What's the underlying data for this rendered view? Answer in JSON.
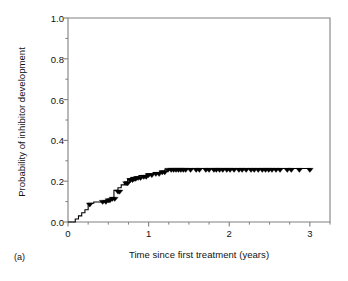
{
  "figure": {
    "panel_letter": "(a)",
    "background_color": "#ffffff",
    "line_color": "#000000",
    "axis_color": "#808080",
    "text_color": "#111111"
  },
  "chart_data": {
    "type": "line",
    "title": "",
    "subtitle": "",
    "xlabel": "Time since first treatment (years)",
    "ylabel": "Probability of inhibitor development",
    "xlim": [
      0,
      3.25
    ],
    "ylim": [
      0.0,
      1.0
    ],
    "xticks": [
      0,
      1,
      2,
      3
    ],
    "xtick_labels": [
      "0",
      "1",
      "2",
      "3"
    ],
    "xminor_ticks": [
      0.25,
      0.5,
      0.75,
      1.25,
      1.5,
      1.75,
      2.25,
      2.5,
      2.75,
      3.25
    ],
    "yticks": [
      0.0,
      0.2,
      0.4,
      0.6,
      0.8,
      1.0
    ],
    "ytick_labels": [
      "0.0",
      "0.2",
      "0.4",
      "0.6",
      "0.8",
      "1.0"
    ],
    "yminor_ticks": [
      0.1,
      0.3,
      0.5,
      0.7,
      0.9
    ],
    "grid": false,
    "legend": null,
    "legend_position": "none",
    "annotations": [],
    "series": [
      {
        "name": "Cumulative incidence of inhibitor development",
        "style": "kaplan-meier-step",
        "x": [
          0.0,
          0.09,
          0.09,
          0.13,
          0.13,
          0.17,
          0.17,
          0.21,
          0.21,
          0.25,
          0.25,
          0.28,
          0.28,
          0.32,
          0.32,
          0.36,
          0.36,
          0.46,
          0.46,
          0.5,
          0.5,
          0.53,
          0.53,
          0.57,
          0.57,
          0.62,
          0.62,
          0.66,
          0.66,
          0.7,
          0.7,
          0.74,
          0.74,
          0.78,
          0.78,
          0.82,
          0.82,
          0.88,
          0.88,
          0.97,
          0.97,
          1.06,
          1.06,
          1.14,
          1.14,
          1.2,
          1.2,
          1.26,
          1.26,
          3.02
        ],
        "y": [
          0.0,
          0.0,
          0.015,
          0.015,
          0.03,
          0.03,
          0.045,
          0.045,
          0.06,
          0.06,
          0.092,
          0.092,
          0.092,
          0.092,
          0.098,
          0.098,
          0.098,
          0.098,
          0.105,
          0.105,
          0.112,
          0.112,
          0.12,
          0.12,
          0.155,
          0.155,
          0.168,
          0.168,
          0.182,
          0.182,
          0.196,
          0.196,
          0.212,
          0.212,
          0.218,
          0.218,
          0.222,
          0.222,
          0.228,
          0.228,
          0.236,
          0.236,
          0.242,
          0.242,
          0.25,
          0.25,
          0.256,
          0.256,
          0.262,
          0.262
        ],
        "plateau_value": 0.262,
        "censor_marker": "filled-down-triangle",
        "censor_x": [
          0.27,
          0.43,
          0.47,
          0.5,
          0.52,
          0.55,
          0.58,
          0.62,
          0.64,
          0.72,
          0.74,
          0.77,
          0.8,
          0.82,
          0.84,
          0.87,
          0.9,
          0.94,
          0.97,
          1.0,
          1.04,
          1.09,
          1.13,
          1.17,
          1.2,
          1.24,
          1.28,
          1.31,
          1.34,
          1.37,
          1.4,
          1.43,
          1.46,
          1.52,
          1.59,
          1.63,
          1.71,
          1.75,
          1.81,
          1.84,
          1.88,
          1.92,
          1.97,
          2.01,
          2.06,
          2.12,
          2.16,
          2.21,
          2.27,
          2.31,
          2.36,
          2.41,
          2.45,
          2.49,
          2.53,
          2.58,
          2.63,
          2.72,
          2.77,
          2.87,
          3.0
        ],
        "censor_y": [
          0.092,
          0.105,
          0.105,
          0.112,
          0.112,
          0.12,
          0.12,
          0.155,
          0.155,
          0.196,
          0.196,
          0.212,
          0.212,
          0.218,
          0.218,
          0.222,
          0.222,
          0.228,
          0.228,
          0.236,
          0.236,
          0.242,
          0.242,
          0.25,
          0.25,
          0.262,
          0.262,
          0.262,
          0.262,
          0.262,
          0.262,
          0.262,
          0.262,
          0.262,
          0.262,
          0.262,
          0.262,
          0.262,
          0.262,
          0.262,
          0.262,
          0.262,
          0.262,
          0.262,
          0.262,
          0.262,
          0.262,
          0.262,
          0.262,
          0.262,
          0.262,
          0.262,
          0.262,
          0.262,
          0.262,
          0.262,
          0.262,
          0.262,
          0.262,
          0.262,
          0.262
        ]
      }
    ]
  }
}
